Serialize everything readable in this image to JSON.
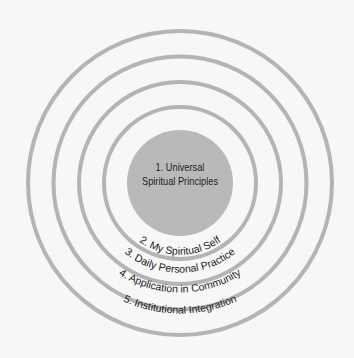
{
  "diagram": {
    "type": "concentric-circles",
    "colors": {
      "background": "#f7f7f7",
      "center_fill": "#b9b9b9",
      "ring_stroke": "#b4b4b4",
      "text": "#222222"
    },
    "center": {
      "number": "1.",
      "line1": "1. Universal",
      "line2": "Spiritual Principles"
    },
    "rings": [
      {
        "label": "2. My Spiritual Self"
      },
      {
        "label": "3. Daily Personal Practice"
      },
      {
        "label": "4. Application in Community"
      },
      {
        "label": "5. Institutional Integration"
      }
    ]
  }
}
